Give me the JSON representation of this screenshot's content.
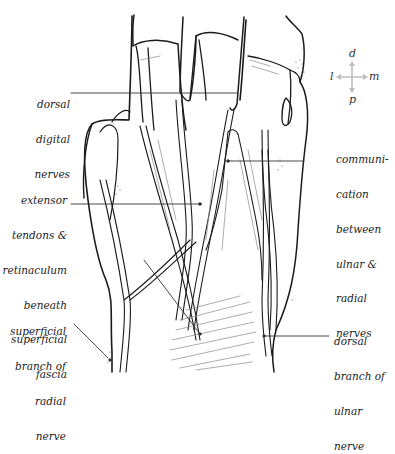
{
  "figure": {
    "type": "anatomical-illustration",
    "colors": {
      "ink": "#1a1a1a",
      "leader": "#333333",
      "compass_arrow": "#bdbdbd",
      "background": "#ffffff"
    }
  },
  "compass": {
    "up": "d",
    "down": "p",
    "left": "l",
    "right": "m"
  },
  "labels": {
    "dorsal_digital_nerves": {
      "lines": [
        "dorsal",
        "digital",
        "nerves"
      ]
    },
    "extensor_tendons": {
      "lines": [
        "extensor",
        "tendons &",
        "retinaculum",
        "beneath",
        "superficial",
        "fascia"
      ]
    },
    "superficial_branch_radial": {
      "lines": [
        "superficial",
        "branch of",
        "radial",
        "nerve"
      ]
    },
    "communication": {
      "lines": [
        "communi-",
        "cation",
        "between",
        "ulnar &",
        "radial",
        "nerves"
      ]
    },
    "dorsal_branch_ulnar": {
      "lines": [
        "dorsal",
        "branch of",
        "ulnar",
        "nerve"
      ]
    }
  }
}
